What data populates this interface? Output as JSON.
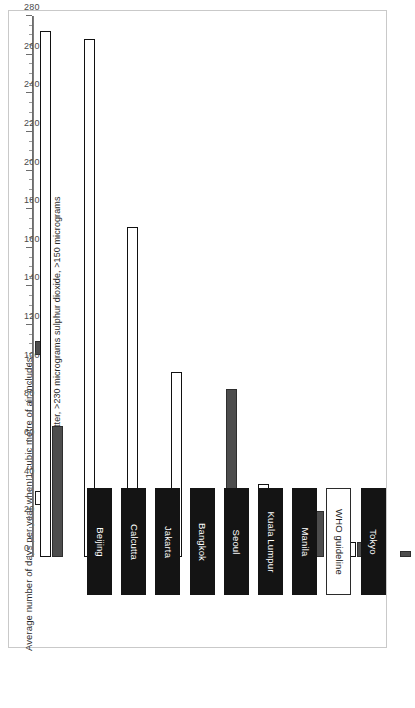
{
  "chart_data": {
    "type": "bar",
    "title": "",
    "ylabel": "Average number of days per year when 1 cubic metre of air includes:",
    "xlabel": "",
    "orientation": "vertical",
    "grid": false,
    "legend_position": "left",
    "ylim": [
      0,
      280
    ],
    "ytick_step": 20,
    "categories": [
      "Beijing",
      "Calcutta",
      "Jakarta",
      "Bangkok",
      "Seoul",
      "Kuala Lumpur",
      "Manila",
      "WHO guideline",
      "Tokyo"
    ],
    "tick_labels": [
      "0",
      "20",
      "40",
      "60",
      "80",
      "100",
      "120",
      "140",
      "160",
      "180",
      "200",
      "220",
      "240",
      "260",
      "280"
    ],
    "series": [
      {
        "name": "particulate matter, >230 micrograms",
        "key": "pm",
        "color": "#ffffff",
        "edge_color": "#111111",
        "values": [
          272,
          268,
          171,
          96,
          0,
          38,
          14,
          8,
          0
        ]
      },
      {
        "name": "sulphur dioxide, >150 micrograms",
        "key": "so2",
        "color": "#4d4d4d",
        "edge_color": "#2e2e2e",
        "values": [
          68,
          25,
          0,
          0,
          87,
          0,
          24,
          8,
          3
        ]
      }
    ],
    "highlight_category": "WHO guideline"
  },
  "legend": {
    "items": [
      {
        "label": "particulate matter, >230 micrograms",
        "swatch": "pm"
      },
      {
        "label": "sulphur dioxide, >150 micrograms",
        "swatch": "so2"
      }
    ]
  },
  "axis": {
    "title": "Average number of days per year when 1 cubic metre of air includes:"
  },
  "colors": {
    "bar_pm_fill": "#ffffff",
    "bar_pm_edge": "#111111",
    "bar_so2_fill": "#4d4d4d",
    "category_chip": "#141414",
    "category_chip_highlight": "#ffffff",
    "frame": "#c9c9c9",
    "axis": "#6d6d6d"
  }
}
